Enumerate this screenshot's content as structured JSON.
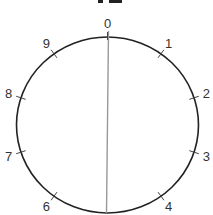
{
  "diagram": {
    "type": "circle-with-labeled-ticks",
    "center": {
      "x": 107.5,
      "y": 125
    },
    "radius_x": 91,
    "radius_y": 88,
    "circle_color": "#222222",
    "chord_color": "#999999",
    "labels": [
      "0",
      "1",
      "2",
      "3",
      "4",
      "",
      "6",
      "7",
      "8",
      "9"
    ],
    "chord": {
      "from_label": "0",
      "to_position": 5
    },
    "top_cutoff_marks": true
  }
}
